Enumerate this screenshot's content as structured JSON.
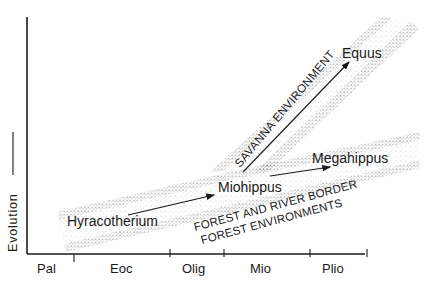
{
  "diagram": {
    "y_axis_label": "Evolution",
    "epochs": [
      {
        "label": "Pal",
        "x": 50
      },
      {
        "label": "Eoc",
        "x": 123
      },
      {
        "label": "Olig",
        "x": 200
      },
      {
        "label": "Mio",
        "x": 256
      },
      {
        "label": "Plio",
        "x": 324
      }
    ],
    "taxa": {
      "hyracotherium": "Hyracotherium",
      "miohippus": "Miohippus",
      "megahippus": "Megahippus",
      "equus": "Equus"
    },
    "environments": {
      "savanna": "SAVANNA ENVIRONMENT",
      "forest_line1": "FOREST AND RIVER BORDER",
      "forest_line2": "FOREST ENVIRONMENTS"
    },
    "colors": {
      "ink": "#1a1a1a",
      "stipple": "#555555",
      "background": "#ffffff"
    }
  }
}
